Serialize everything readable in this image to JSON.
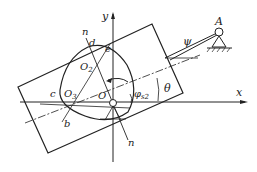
{
  "diagram": {
    "labels": {
      "y_axis": "y",
      "x_axis": "x",
      "pivot": "A",
      "psi": "ψ",
      "theta": "θ",
      "phi": "φ",
      "phi_sub": "s2",
      "n_top": "n",
      "n_bottom": "n",
      "d": "d",
      "e": "e",
      "c": "c",
      "b": "b",
      "O": "O",
      "O1": "O",
      "O1_sub": "1",
      "O2": "O",
      "O2_sub": "2",
      "O3": "O",
      "O3_sub": "3"
    },
    "colors": {
      "stroke": "#222222",
      "background": "#ffffff"
    }
  }
}
